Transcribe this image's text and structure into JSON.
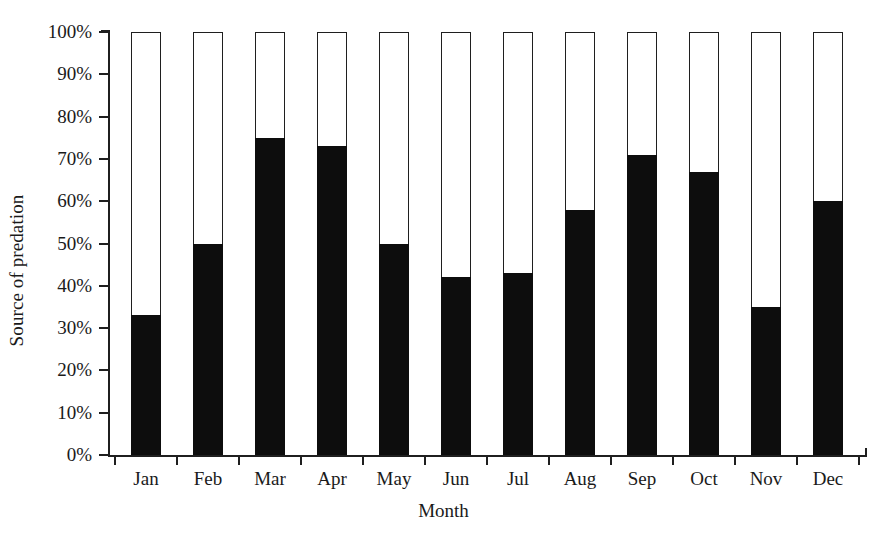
{
  "chart_data": {
    "type": "bar",
    "title": "",
    "subtitle": "",
    "xlabel": "Month",
    "ylabel": "Source of predation",
    "categories": [
      "Jan",
      "Feb",
      "Mar",
      "Apr",
      "May",
      "Jun",
      "Jul",
      "Aug",
      "Sep",
      "Oct",
      "Nov",
      "Dec"
    ],
    "values": [
      33,
      50,
      75,
      73,
      50,
      42,
      43,
      58,
      71,
      67,
      35,
      60
    ],
    "series": [
      {
        "name": "Filled (black) portion",
        "color": "#0d0d0d",
        "values": [
          33,
          50,
          75,
          73,
          50,
          42,
          43,
          58,
          71,
          67,
          35,
          60
        ]
      },
      {
        "name": "Unfilled (white) portion",
        "color": "#ffffff",
        "values": [
          67,
          50,
          25,
          27,
          50,
          58,
          57,
          42,
          29,
          33,
          65,
          40
        ]
      }
    ],
    "stacked": true,
    "stack_total": 100,
    "ylim": [
      0,
      100
    ],
    "ytick_values": [
      0,
      10,
      20,
      30,
      40,
      50,
      60,
      70,
      80,
      90,
      100
    ],
    "ytick_labels": [
      "0%",
      "10%",
      "20%",
      "30%",
      "40%",
      "50%",
      "60%",
      "70%",
      "80%",
      "90%",
      "100%"
    ],
    "grid": false,
    "legend": null,
    "legend_position": "none",
    "annotations": []
  },
  "axes": {
    "y_title": "Source of predation",
    "x_title": "Month"
  },
  "style": {
    "background": "#ffffff",
    "axis_color": "#1f1f1f",
    "fill_color": "#0d0d0d",
    "outline_color": "#1f1f1f",
    "text_color": "#1a1a1a"
  }
}
